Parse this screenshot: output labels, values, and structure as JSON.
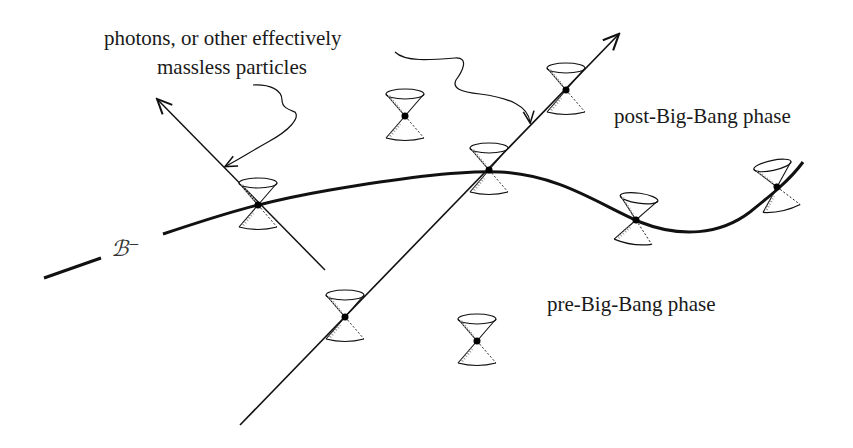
{
  "diagram": {
    "labels": {
      "photons_line1": "photons, or other effectively",
      "photons_line2": "massless particles",
      "post_phase": "post-Big-Bang phase",
      "pre_phase": "pre-Big-Bang phase",
      "hypersurface": "ℬ⁻"
    },
    "colors": {
      "ink": "#111111",
      "background": "#ffffff",
      "shading": "#888888"
    },
    "elements": {
      "hypersurface_curve": "B-minus crossover surface (thick curve)",
      "photon_worldline_left": "worldline pointing up-left",
      "photon_worldline_right": "worldline pointing up-right",
      "light_cones": [
        {
          "id": "cone-on-curve-left",
          "x": 258,
          "y": 205
        },
        {
          "id": "cone-on-curve-center",
          "x": 489,
          "y": 170
        },
        {
          "id": "cone-on-curve-right1",
          "x": 636,
          "y": 220
        },
        {
          "id": "cone-on-curve-right2",
          "x": 777,
          "y": 187
        },
        {
          "id": "cone-on-line-top",
          "x": 566,
          "y": 90
        },
        {
          "id": "cone-free-top",
          "x": 405,
          "y": 116
        },
        {
          "id": "cone-on-line-bottom",
          "x": 345,
          "y": 317
        },
        {
          "id": "cone-free-bottom",
          "x": 477,
          "y": 341
        }
      ]
    }
  }
}
